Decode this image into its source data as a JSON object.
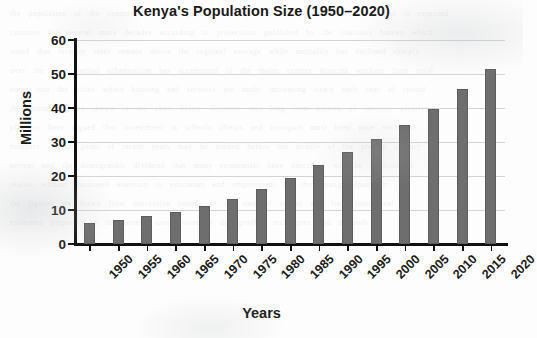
{
  "chart_data": {
    "type": "bar",
    "title": "Kenya's Population Size (1950–2020)",
    "xlabel": "Years",
    "ylabel": "Millions",
    "categories": [
      "1950",
      "1955",
      "1960",
      "1965",
      "1970",
      "1975",
      "1980",
      "1985",
      "1990",
      "1995",
      "2000",
      "2005",
      "2010",
      "2015",
      "2020"
    ],
    "values": [
      6.1,
      7.2,
      8.3,
      9.3,
      11.1,
      13.3,
      16.1,
      19.5,
      23.1,
      27.0,
      30.8,
      34.9,
      39.8,
      45.5,
      51.5
    ],
    "ylim": [
      0,
      60
    ],
    "y_ticks": [
      0,
      10,
      20,
      30,
      40,
      50,
      60
    ],
    "y_tick_labels": [
      "0",
      "10",
      "20",
      "30",
      "40",
      "50",
      "60"
    ],
    "grid": "horizontal",
    "legend": "none",
    "bar_color": "#6e6e6e",
    "axis_color": "#111111",
    "gridline_color": "#d4d4d4",
    "background_color": "#fdfdfd"
  },
  "page": {
    "ghost_text": "the population of the country has been growing steadily since independence and the trend is expected\ncontinue for several more decades according to projections published by the statistics bureau which\nnoted that fertility rates remain above the regional average while mortality has declined sharply\nover the same period urbanisation has accelerated in the major centres drawing workers from rural\nareas into the cities where housing and services are under increasing strain each year of record\nthe census figures shown in the chart below illustrate this long term pattern of increase clearly\nplanners have argued that investment in schools clinics and transport must keep pace with the\nnumbers or the gains of recent years may be eroded before the middle of the present century\narrives and the demographic dividend that many economists have described will be difficult to\nrealise without sustained attention to education and employment for the young population\nthe figures are drawn from successive rounds of the national census and from intercensal\nestimates prepared by the bureau using standard demographic techniques and methods"
  }
}
